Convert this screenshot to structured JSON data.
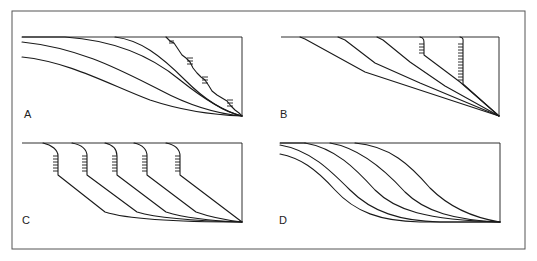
{
  "figure": {
    "panels": [
      {
        "id": "A",
        "label": "A",
        "description": "Smooth concave profiles converging at lower right; rightmost profile is irregular with hachured steps"
      },
      {
        "id": "B",
        "label": "B",
        "description": "Straight-segment profiles converging at lower right; two profiles begin with vertical hachured scarps"
      },
      {
        "id": "C",
        "label": "C",
        "description": "Five profiles each starting with a hachured scarp, then straight slope, flattening to a common base"
      },
      {
        "id": "D",
        "label": "D",
        "description": "Sigmoidal (S-shaped) profiles shifting progressively to the right, converging at lower right"
      }
    ],
    "colors": {
      "line": "#1a1a1a",
      "frame": "#555555",
      "background": "#ffffff"
    }
  }
}
